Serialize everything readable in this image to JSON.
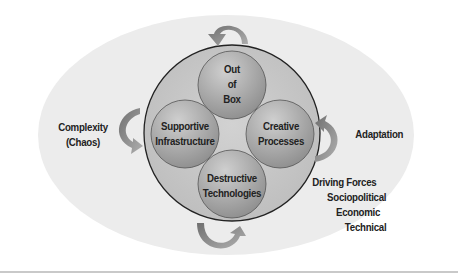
{
  "diagram": {
    "colors": {
      "outer_ellipse": "#ececec",
      "main_circle_fill": "#c4c4c4",
      "main_circle_stroke": "#222222",
      "sub_circle_light": "#c0c0c0",
      "sub_circle_dark": "#8f8f8f",
      "arrow_dark": "#7b7b7b",
      "arrow_light": "#a8a8a8",
      "text": "#222222"
    },
    "inner_circles": [
      {
        "id": "out-of-box",
        "lines": [
          "Out",
          "of",
          "Box"
        ]
      },
      {
        "id": "supportive-infrastructure",
        "lines": [
          "Supportive",
          "Infrastructure"
        ]
      },
      {
        "id": "creative-processes",
        "lines": [
          "Creative",
          "Processes"
        ]
      },
      {
        "id": "destructive-technologies",
        "lines": [
          "Destructive",
          "Technologies"
        ]
      }
    ],
    "left_label": {
      "line1": "Complexity",
      "line2": "(Chaos)"
    },
    "right_label": "Adaptation",
    "driving_forces": {
      "title": "Driving Forces",
      "items": [
        "Sociopolitical",
        "Economic",
        "Technical"
      ]
    }
  }
}
